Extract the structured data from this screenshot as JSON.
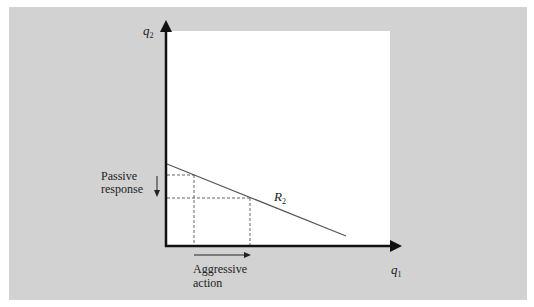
{
  "diagram": {
    "axes": {
      "x_label": "q",
      "x_label_sub": "1",
      "y_label": "q",
      "y_label_sub": "2"
    },
    "curve": {
      "label": "R",
      "label_sub": "2",
      "name": "reaction function of firm 2"
    },
    "annotations": {
      "passive_line1": "Passive",
      "passive_line2": "response",
      "aggressive_line1": "Aggressive",
      "aggressive_line2": "action"
    },
    "colors": {
      "background_panel": "#d2d2d2",
      "plot_area": "#ffffff",
      "lines": "#222222",
      "curve": "#555555"
    }
  }
}
